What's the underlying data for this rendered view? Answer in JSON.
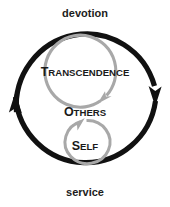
{
  "diagram": {
    "type": "concentric-circular-arrow-diagram",
    "colors": {
      "outer_ring": "#111111",
      "inner_rings": "#a8a8a8",
      "text": "#1a1a1a",
      "background": "#ffffff"
    },
    "edge_labels": {
      "top": "devotion",
      "bottom": "service"
    },
    "rings": [
      {
        "id": "ring-outer",
        "label": "",
        "color": "#111111",
        "arrow_heads": [
          "right-down",
          "left-up"
        ],
        "direction": "clockwise"
      },
      {
        "id": "ring-transcendence",
        "label_first": "T",
        "label_rest": "RANSCENDENCE",
        "label_full": "TRANSCENDENCE",
        "color": "#a8a8a8",
        "arrow_heads": [
          "bottom-right-down"
        ],
        "direction": "clockwise"
      },
      {
        "id": "ring-self",
        "label_first": "S",
        "label_rest": "ELF",
        "label_full": "SELF",
        "color": "#a8a8a8",
        "arrow_heads": [
          "top-left-up"
        ],
        "direction": "clockwise"
      }
    ],
    "middle_label": {
      "label_first": "O",
      "label_rest": "THERS",
      "label_full": "OTHERS"
    }
  }
}
